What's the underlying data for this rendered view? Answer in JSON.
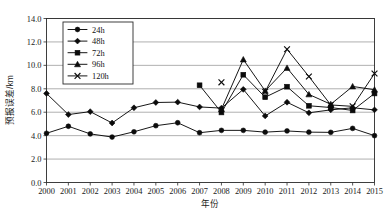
{
  "chart_data": {
    "type": "line",
    "title": "",
    "xlabel": "年份",
    "ylabel": "预报误差/km",
    "x": [
      2000,
      2001,
      2002,
      2003,
      2004,
      2005,
      2006,
      2007,
      2008,
      2009,
      2010,
      2011,
      2012,
      2013,
      2014,
      2015
    ],
    "xtick_labels": [
      "2000",
      "2001",
      "2002",
      "2003",
      "2004",
      "2005",
      "2006",
      "2007",
      "2008",
      "2009",
      "2010",
      "2011",
      "2012",
      "2013",
      "2014",
      "2015"
    ],
    "ytick_labels": [
      "0.0",
      "2.0",
      "4.0",
      "6.0",
      "8.0",
      "10.0",
      "12.0",
      "14.0"
    ],
    "yticks": [
      0.0,
      2.0,
      4.0,
      6.0,
      8.0,
      10.0,
      12.0,
      14.0
    ],
    "ylim": [
      0.0,
      14.0
    ],
    "xlim": [
      2000,
      2015
    ],
    "grid": true,
    "grid_axis": "y",
    "legend_position": "upper-left-inside",
    "series": [
      {
        "name": "24h",
        "marker": "circle",
        "color": "#0b0b0b",
        "values": [
          4.2,
          4.8,
          4.15,
          3.88,
          4.33,
          4.85,
          5.1,
          4.25,
          4.45,
          4.45,
          4.3,
          4.4,
          4.3,
          4.28,
          4.62,
          4.0
        ]
      },
      {
        "name": "48h",
        "marker": "diamond",
        "color": "#0b0b0b",
        "values": [
          7.6,
          5.8,
          6.05,
          5.08,
          6.38,
          6.83,
          6.86,
          6.45,
          6.35,
          7.95,
          5.68,
          6.85,
          5.95,
          6.2,
          6.38,
          6.2
        ]
      },
      {
        "name": "72h",
        "marker": "square",
        "color": "#0b0b0b",
        "values": [
          null,
          null,
          null,
          null,
          null,
          null,
          null,
          8.3,
          5.98,
          9.2,
          7.28,
          8.18,
          6.55,
          6.4,
          6.15,
          7.6
        ]
      },
      {
        "name": "96h",
        "marker": "triangle",
        "color": "#0b0b0b",
        "values": [
          null,
          null,
          null,
          null,
          null,
          null,
          null,
          null,
          6.25,
          10.5,
          7.82,
          9.78,
          7.52,
          6.68,
          8.2,
          7.92
        ]
      },
      {
        "name": "120h",
        "marker": "cross",
        "color": "#0b0b0b",
        "values": [
          null,
          null,
          null,
          null,
          null,
          null,
          null,
          null,
          8.55,
          null,
          7.75,
          11.38,
          9.05,
          6.62,
          6.5,
          9.3
        ]
      }
    ]
  },
  "legend": {
    "entries": [
      {
        "label": "24h",
        "marker": "circle"
      },
      {
        "label": "48h",
        "marker": "diamond"
      },
      {
        "label": "72h",
        "marker": "square"
      },
      {
        "label": "96h",
        "marker": "triangle"
      },
      {
        "label": "120h",
        "marker": "cross"
      }
    ]
  }
}
